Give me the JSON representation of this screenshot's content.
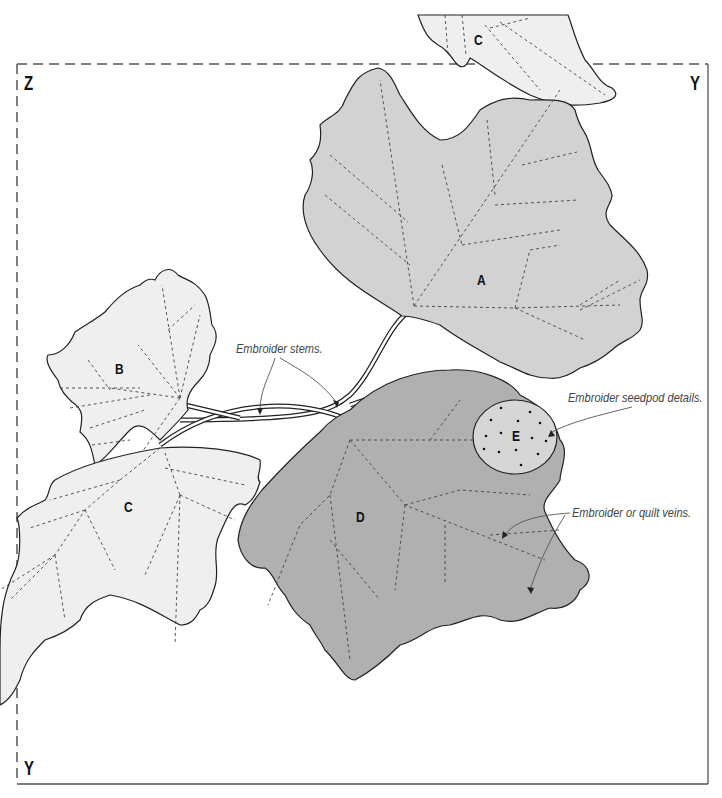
{
  "corner_labels": {
    "top_left": "Z",
    "top_right": "Y",
    "bottom_left": "Y"
  },
  "leaves": [
    {
      "id": "A",
      "label": "A",
      "fill": "#d2d2d2"
    },
    {
      "id": "B",
      "label": "B",
      "fill": "#efefef"
    },
    {
      "id": "C_top",
      "label": "C",
      "fill": "#efefef"
    },
    {
      "id": "C",
      "label": "C",
      "fill": "#efefef"
    },
    {
      "id": "D",
      "label": "D",
      "fill": "#b0b0b0"
    },
    {
      "id": "E",
      "label": "E",
      "fill": "#d6d6d6"
    }
  ],
  "annotations": {
    "stems": "Embroider stems.",
    "seedpod": "Embroider seedpod details.",
    "veins": "Embroider or quilt veins."
  },
  "colors": {
    "outline": "#222222",
    "dashed_border": "#555555",
    "vein": "#444444",
    "annotation_text": "#444444"
  }
}
